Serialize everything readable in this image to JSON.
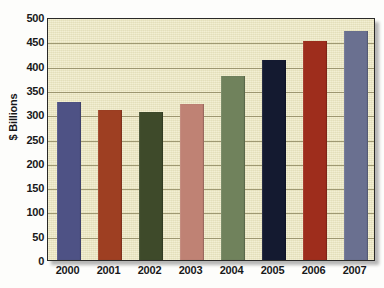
{
  "chart_data": {
    "type": "bar",
    "title": "",
    "subtitle": "",
    "xlabel": "",
    "ylabel": "$ Billions",
    "categories": [
      "2000",
      "2001",
      "2002",
      "2003",
      "2004",
      "2005",
      "2006",
      "2007"
    ],
    "values": [
      326,
      308,
      304,
      321,
      378,
      412,
      450,
      472
    ],
    "series": [
      {
        "name": "$ Billions",
        "values": [
          326,
          308,
          304,
          321,
          378,
          412,
          450,
          472
        ]
      }
    ],
    "bar_colors": [
      "#4e5285",
      "#9e3f22",
      "#3e4a2a",
      "#bf8274",
      "#70825c",
      "#141a30",
      "#9e2d1c",
      "#6a7090"
    ],
    "ylim": [
      0,
      500
    ],
    "ytick_step": 50,
    "ytick_labels": [
      "500",
      "450",
      "400",
      "350",
      "300",
      "250",
      "200",
      "150",
      "100",
      "50",
      "0"
    ],
    "ytick_values": [
      500,
      450,
      400,
      350,
      300,
      250,
      200,
      150,
      100,
      50,
      0
    ],
    "grid": "horizontal",
    "legend": "none",
    "plot_background": "#efeac4",
    "gridline_color": "#8f8a63",
    "axis_color": "#2a2a28",
    "text_color": "#18181a"
  }
}
